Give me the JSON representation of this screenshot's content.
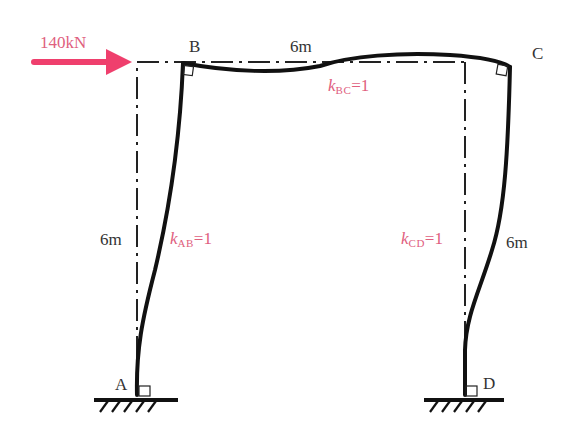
{
  "diagram": {
    "type": "portal frame deflected shape",
    "load": {
      "label": "140kN",
      "direction": "right",
      "color": "#ef3f6d"
    },
    "nodes": {
      "A": {
        "label": "A",
        "support": "fixed"
      },
      "B": {
        "label": "B"
      },
      "C": {
        "label": "C"
      },
      "D": {
        "label": "D",
        "support": "fixed"
      }
    },
    "dimensions": {
      "beam_length": "6m",
      "left_column_height": "6m",
      "right_column_height": "6m"
    },
    "stiffness": {
      "AB": {
        "k": "k",
        "sub": "AB",
        "value": "=1"
      },
      "BC": {
        "k": "k",
        "sub": "BC",
        "value": "=1"
      },
      "CD": {
        "k": "k",
        "sub": "CD",
        "value": "=1"
      }
    },
    "colors": {
      "member": "#111111",
      "label": "#333333",
      "stiffness_label": "#e0607e",
      "arrow": "#ef3f6d"
    }
  }
}
